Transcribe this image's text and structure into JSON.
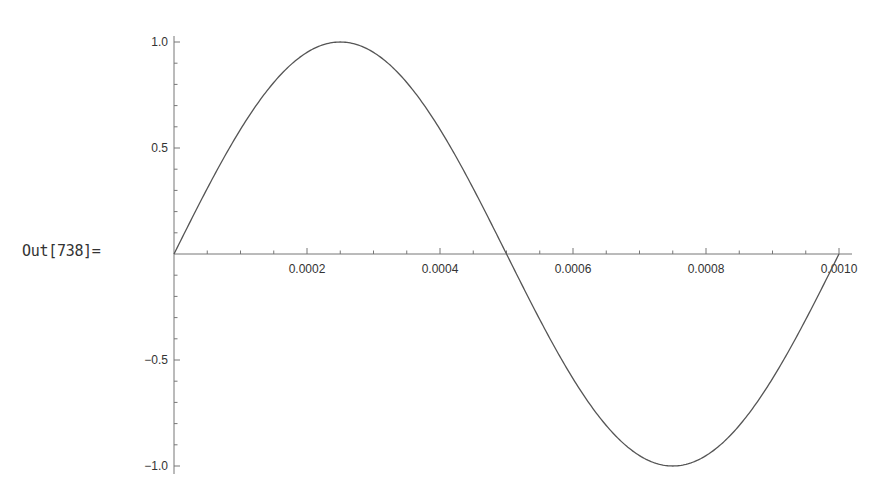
{
  "cell": {
    "out_label": "Out[738]="
  },
  "chart_data": {
    "type": "line",
    "title": "",
    "xlabel": "",
    "ylabel": "",
    "function": "sin(2*pi*1000*t)",
    "xlim": [
      0,
      0.001
    ],
    "ylim": [
      -1.0,
      1.0
    ],
    "grid": false,
    "x_ticks": [
      "0.0002",
      "0.0004",
      "0.0006",
      "0.0008",
      "0.0010"
    ],
    "x_tick_values": [
      0.0002,
      0.0004,
      0.0006,
      0.0008,
      0.001
    ],
    "y_ticks": [
      "1.0",
      "0.5",
      "-0.5",
      "-1.0"
    ],
    "y_tick_values": [
      1.0,
      0.5,
      -0.5,
      -1.0
    ],
    "series": [
      {
        "name": "sin",
        "x": [
          0,
          0.000125,
          0.00025,
          0.000375,
          0.0005,
          0.000625,
          0.00075,
          0.000875,
          0.001
        ],
        "values": [
          0,
          0.707,
          1.0,
          0.707,
          0,
          -0.707,
          -1.0,
          -0.707,
          0
        ]
      }
    ],
    "colors": {
      "line": "#555555",
      "axis": "#777777",
      "text": "#333333"
    }
  }
}
